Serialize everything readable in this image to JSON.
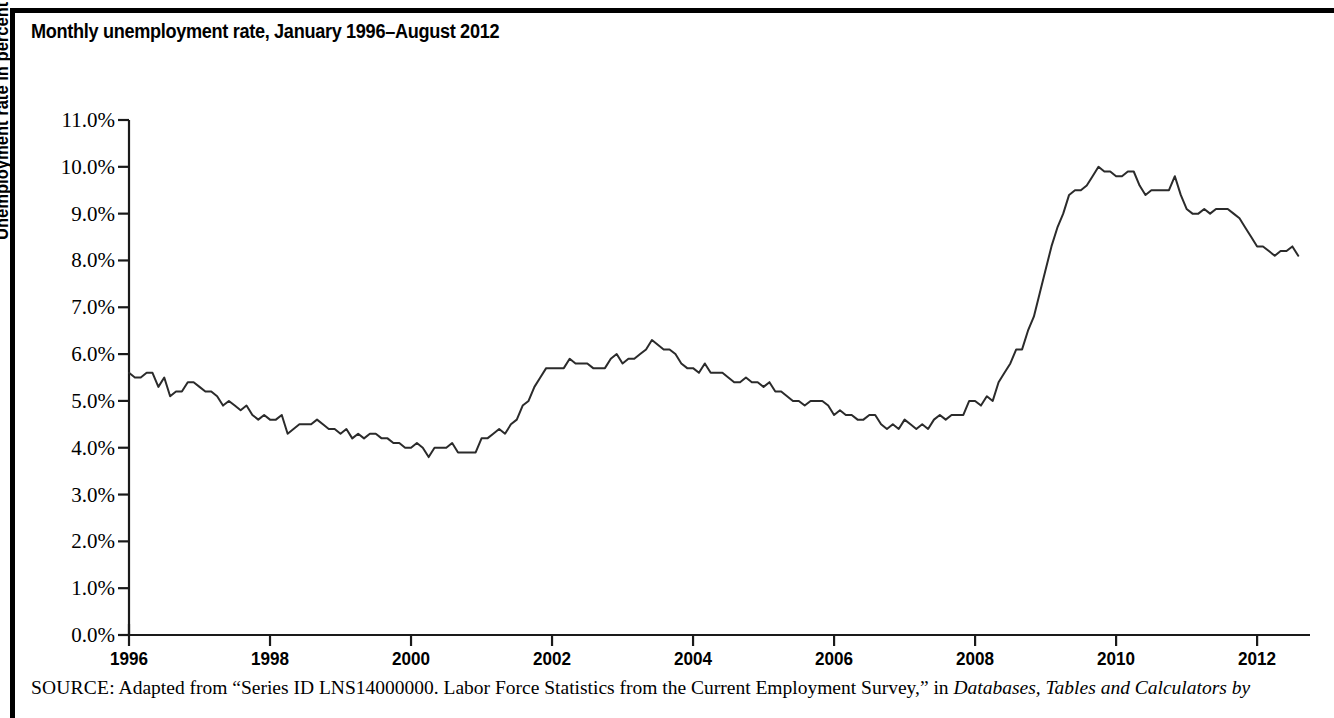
{
  "figure": {
    "title": "Monthly unemployment rate, January 1996–August 2012",
    "source_prefix": "SOURCE:",
    "source_text": "Adapted from “Series ID LNS14000000. Labor Force Statistics from the Current Employment Survey,” in",
    "source_italic": "Databases, Tables and Calculators by",
    "border_color": "#000000",
    "line_color": "#2b2b2b"
  },
  "chart_data": {
    "type": "line",
    "title": "Monthly unemployment rate, January 1996–August 2012",
    "xlabel": "",
    "ylabel": "Unemployment rate in percent",
    "xlim": [
      1996.0,
      2012.75
    ],
    "ylim": [
      0.0,
      11.0
    ],
    "grid": false,
    "legend": false,
    "x_tick_labels": [
      "1996",
      "1998",
      "2000",
      "2002",
      "2004",
      "2006",
      "2008",
      "2010",
      "2012"
    ],
    "x_tick_values": [
      1996,
      1998,
      2000,
      2002,
      2004,
      2006,
      2008,
      2010,
      2012
    ],
    "y_tick_labels": [
      "0.0%",
      "1.0%",
      "2.0%",
      "3.0%",
      "4.0%",
      "5.0%",
      "6.0%",
      "7.0%",
      "8.0%",
      "9.0%",
      "10.0%",
      "11.0%"
    ],
    "y_tick_values": [
      0,
      1,
      2,
      3,
      4,
      5,
      6,
      7,
      8,
      9,
      10,
      11
    ],
    "series": [
      {
        "name": "Unemployment rate",
        "x_start": 1996.0,
        "x_step": 0.0833333,
        "units": "percent",
        "values": [
          5.6,
          5.5,
          5.5,
          5.6,
          5.6,
          5.3,
          5.5,
          5.1,
          5.2,
          5.2,
          5.4,
          5.4,
          5.3,
          5.2,
          5.2,
          5.1,
          4.9,
          5.0,
          4.9,
          4.8,
          4.9,
          4.7,
          4.6,
          4.7,
          4.6,
          4.6,
          4.7,
          4.3,
          4.4,
          4.5,
          4.5,
          4.5,
          4.6,
          4.5,
          4.4,
          4.4,
          4.3,
          4.4,
          4.2,
          4.3,
          4.2,
          4.3,
          4.3,
          4.2,
          4.2,
          4.1,
          4.1,
          4.0,
          4.0,
          4.1,
          4.0,
          3.8,
          4.0,
          4.0,
          4.0,
          4.1,
          3.9,
          3.9,
          3.9,
          3.9,
          4.2,
          4.2,
          4.3,
          4.4,
          4.3,
          4.5,
          4.6,
          4.9,
          5.0,
          5.3,
          5.5,
          5.7,
          5.7,
          5.7,
          5.7,
          5.9,
          5.8,
          5.8,
          5.8,
          5.7,
          5.7,
          5.7,
          5.9,
          6.0,
          5.8,
          5.9,
          5.9,
          6.0,
          6.1,
          6.3,
          6.2,
          6.1,
          6.1,
          6.0,
          5.8,
          5.7,
          5.7,
          5.6,
          5.8,
          5.6,
          5.6,
          5.6,
          5.5,
          5.4,
          5.4,
          5.5,
          5.4,
          5.4,
          5.3,
          5.4,
          5.2,
          5.2,
          5.1,
          5.0,
          5.0,
          4.9,
          5.0,
          5.0,
          5.0,
          4.9,
          4.7,
          4.8,
          4.7,
          4.7,
          4.6,
          4.6,
          4.7,
          4.7,
          4.5,
          4.4,
          4.5,
          4.4,
          4.6,
          4.5,
          4.4,
          4.5,
          4.4,
          4.6,
          4.7,
          4.6,
          4.7,
          4.7,
          4.7,
          5.0,
          5.0,
          4.9,
          5.1,
          5.0,
          5.4,
          5.6,
          5.8,
          6.1,
          6.1,
          6.5,
          6.8,
          7.3,
          7.8,
          8.3,
          8.7,
          9.0,
          9.4,
          9.5,
          9.5,
          9.6,
          9.8,
          10.0,
          9.9,
          9.9,
          9.8,
          9.8,
          9.9,
          9.9,
          9.6,
          9.4,
          9.5,
          9.5,
          9.5,
          9.5,
          9.8,
          9.4,
          9.1,
          9.0,
          9.0,
          9.1,
          9.0,
          9.1,
          9.1,
          9.1,
          9.0,
          8.9,
          8.7,
          8.5,
          8.3,
          8.3,
          8.2,
          8.1,
          8.2,
          8.2,
          8.3,
          8.1
        ]
      }
    ]
  }
}
